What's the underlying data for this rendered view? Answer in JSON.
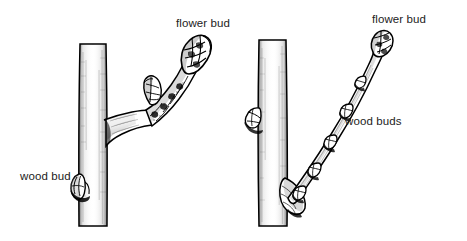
{
  "figure": {
    "background_color": "#ffffff",
    "ink_color": "#000000",
    "text_color": "#222222",
    "width": 467,
    "height": 241
  },
  "panels": [
    {
      "id": "left",
      "description": "Thick stubby fruiting spur branching from a vertical stem, bearing a large fat scaly flower bud at the tip",
      "labels": {
        "flower_bud": "flower bud",
        "wood_bud": "wood bud"
      }
    },
    {
      "id": "right",
      "description": "Slender long shoot branching from a vertical stem, bearing small pointed wood buds along its length and a flower bud at the tip",
      "labels": {
        "flower_bud": "flower bud",
        "wood_buds": "wood buds"
      }
    }
  ],
  "labels": {
    "left_flower_bud": "flower bud",
    "left_wood_bud": "wood bud",
    "right_flower_bud": "flower bud",
    "right_wood_buds": "wood buds"
  }
}
